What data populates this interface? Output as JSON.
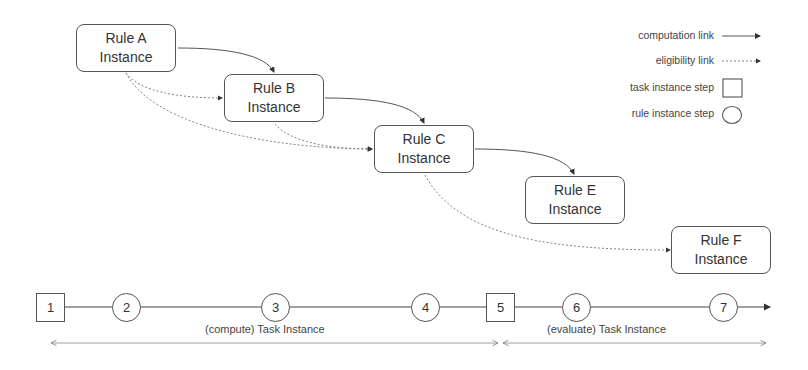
{
  "diagram": {
    "rules": [
      {
        "id": "A",
        "line1": "Rule A",
        "line2": "Instance"
      },
      {
        "id": "B",
        "line1": "Rule B",
        "line2": "Instance"
      },
      {
        "id": "C",
        "line1": "Rule C",
        "line2": "Instance"
      },
      {
        "id": "E",
        "line1": "Rule E",
        "line2": "Instance"
      },
      {
        "id": "F",
        "line1": "Rule F",
        "line2": "Instance"
      }
    ],
    "computation_links": [
      [
        "A",
        "B"
      ],
      [
        "B",
        "C"
      ],
      [
        "C",
        "E"
      ]
    ],
    "eligibility_links": [
      [
        "A",
        "B"
      ],
      [
        "A",
        "C"
      ],
      [
        "B",
        "C"
      ],
      [
        "C",
        "F"
      ]
    ],
    "legend": {
      "computation": "computation link",
      "eligibility": "eligibility link",
      "task_step": "task instance step",
      "rule_step": "rule instance step"
    },
    "timeline": {
      "steps": [
        {
          "label": "1",
          "type": "task"
        },
        {
          "label": "2",
          "type": "rule"
        },
        {
          "label": "3",
          "type": "rule"
        },
        {
          "label": "4",
          "type": "rule"
        },
        {
          "label": "5",
          "type": "task"
        },
        {
          "label": "6",
          "type": "rule"
        },
        {
          "label": "7",
          "type": "rule"
        }
      ],
      "spans": [
        {
          "label": "(compute) Task Instance",
          "from": "1",
          "to": "5"
        },
        {
          "label": "(evaluate) Task Instance",
          "from": "5",
          "to": "end"
        }
      ]
    }
  }
}
